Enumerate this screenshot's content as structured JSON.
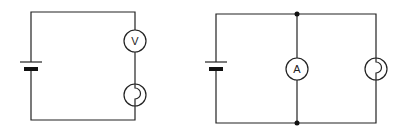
{
  "diagram": {
    "type": "circuit-diagrams",
    "circuits": [
      {
        "id": "circuit-1",
        "description": "Series circuit: cell, voltmeter, lamp",
        "components": [
          {
            "type": "cell"
          },
          {
            "type": "voltmeter",
            "label": "V"
          },
          {
            "type": "lamp"
          }
        ]
      },
      {
        "id": "circuit-2",
        "description": "Cell with ammeter and lamp in parallel branches",
        "components": [
          {
            "type": "cell"
          },
          {
            "type": "ammeter",
            "label": "A"
          },
          {
            "type": "lamp"
          },
          {
            "type": "junction"
          },
          {
            "type": "junction"
          }
        ]
      }
    ]
  }
}
